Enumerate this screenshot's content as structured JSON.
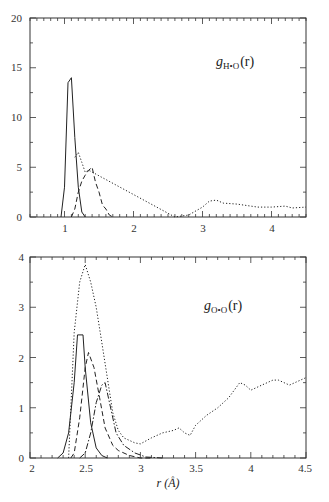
{
  "chart_data": [
    {
      "type": "line",
      "panel": "top",
      "title": "",
      "annotation": {
        "symbol": "g",
        "subscript": "H•O",
        "arg": "(r)"
      },
      "xlabel": "",
      "ylabel": "",
      "xlim": [
        0.5,
        4.5
      ],
      "ylim": [
        0,
        20
      ],
      "xticks": [
        1,
        2,
        3,
        4
      ],
      "yticks": [
        0,
        5,
        10,
        15,
        20
      ],
      "grid": false,
      "legend": null,
      "series": [
        {
          "name": "solid",
          "style": "solid",
          "x": [
            0.95,
            1.0,
            1.05,
            1.1,
            1.15,
            1.2,
            1.25,
            1.3
          ],
          "y": [
            0,
            3.0,
            13.5,
            14.0,
            8.0,
            3.0,
            0.5,
            0
          ]
        },
        {
          "name": "dashed",
          "style": "dashed",
          "x": [
            1.1,
            1.15,
            1.2,
            1.25,
            1.3,
            1.35,
            1.4,
            1.45,
            1.5,
            1.55,
            1.6,
            1.65,
            1.7
          ],
          "y": [
            0,
            0.8,
            2.5,
            3.6,
            4.2,
            4.7,
            5.0,
            3.5,
            2.5,
            1.2,
            0.8,
            0.2,
            0
          ]
        },
        {
          "name": "dotted",
          "style": "dotted",
          "x": [
            1.15,
            1.2,
            1.25,
            1.3,
            1.35,
            2.6,
            2.8,
            3.0,
            3.1,
            3.2,
            3.3,
            3.5,
            3.7,
            3.8,
            4.0,
            4.2,
            4.3,
            4.5
          ],
          "y": [
            6.0,
            6.5,
            5.5,
            4.5,
            4.7,
            0,
            0.2,
            1.0,
            1.6,
            1.7,
            1.4,
            1.3,
            1.1,
            1.0,
            1.0,
            1.1,
            0.9,
            1.0
          ]
        }
      ]
    },
    {
      "type": "line",
      "panel": "bottom",
      "title": "",
      "annotation": {
        "symbol": "g",
        "subscript": "O•O",
        "arg": "(r)"
      },
      "xlabel": "r (Å)",
      "ylabel": "",
      "xlim": [
        2,
        4.5
      ],
      "ylim": [
        0,
        4
      ],
      "xticks": [
        2,
        2.5,
        3,
        3.5,
        4,
        4.5
      ],
      "yticks": [
        0,
        1,
        2,
        3,
        4
      ],
      "grid": false,
      "legend": null,
      "series": [
        {
          "name": "solid",
          "style": "solid",
          "x": [
            2.25,
            2.3,
            2.35,
            2.4,
            2.43,
            2.48,
            2.5,
            2.55,
            2.6,
            2.65,
            2.7
          ],
          "y": [
            0,
            0.1,
            0.5,
            1.5,
            2.45,
            2.45,
            1.8,
            0.7,
            0.2,
            0.05,
            0
          ]
        },
        {
          "name": "dashed",
          "style": "dashed",
          "x": [
            2.37,
            2.4,
            2.45,
            2.5,
            2.53,
            2.58,
            2.63,
            2.68,
            2.75,
            2.8,
            2.9,
            3.0,
            3.1
          ],
          "y": [
            0,
            0.1,
            0.8,
            1.8,
            2.1,
            1.8,
            1.2,
            0.6,
            0.25,
            0.15,
            0.05,
            0,
            0
          ]
        },
        {
          "name": "dash-dot",
          "style": "dashdot",
          "x": [
            2.45,
            2.5,
            2.55,
            2.6,
            2.65,
            2.68,
            2.72,
            2.78,
            2.85,
            2.95,
            3.05,
            3.2
          ],
          "y": [
            0,
            0.1,
            0.5,
            1.1,
            1.45,
            1.5,
            1.1,
            0.5,
            0.25,
            0.1,
            0.02,
            0
          ]
        },
        {
          "name": "dotted",
          "style": "dotted",
          "x": [
            2.35,
            2.4,
            2.45,
            2.5,
            2.55,
            2.6,
            2.65,
            2.7,
            2.75,
            2.8,
            2.85,
            2.9,
            2.95,
            3.0,
            3.1,
            3.2,
            3.3,
            3.35,
            3.4,
            3.45,
            3.5,
            3.6,
            3.7,
            3.8,
            3.85,
            3.9,
            3.95,
            4.0,
            4.1,
            4.2,
            4.25,
            4.3,
            4.35,
            4.4,
            4.5
          ],
          "y": [
            0,
            2.5,
            3.5,
            3.85,
            3.5,
            3.0,
            2.3,
            1.6,
            0.9,
            0.55,
            0.4,
            0.35,
            0.3,
            0.28,
            0.4,
            0.5,
            0.55,
            0.6,
            0.5,
            0.45,
            0.65,
            0.85,
            1.0,
            1.2,
            1.35,
            1.5,
            1.45,
            1.35,
            1.45,
            1.55,
            1.55,
            1.5,
            1.45,
            1.5,
            1.6
          ]
        }
      ]
    }
  ],
  "panels": {
    "top": {
      "xtick_labels": [
        "1",
        "2",
        "3",
        "4"
      ],
      "ytick_labels": [
        "0",
        "5",
        "10",
        "15",
        "20"
      ],
      "label_g": "g",
      "label_sub": "H•O",
      "label_arg": "(r)"
    },
    "bottom": {
      "xtick_labels": [
        "2",
        "2.5",
        "3",
        "3.5",
        "4",
        "4.5"
      ],
      "ytick_labels": [
        "0",
        "1",
        "2",
        "3",
        "4"
      ],
      "label_g": "g",
      "label_sub": "O•O",
      "label_arg": "(r)",
      "xlabel": "r (Å)"
    }
  }
}
